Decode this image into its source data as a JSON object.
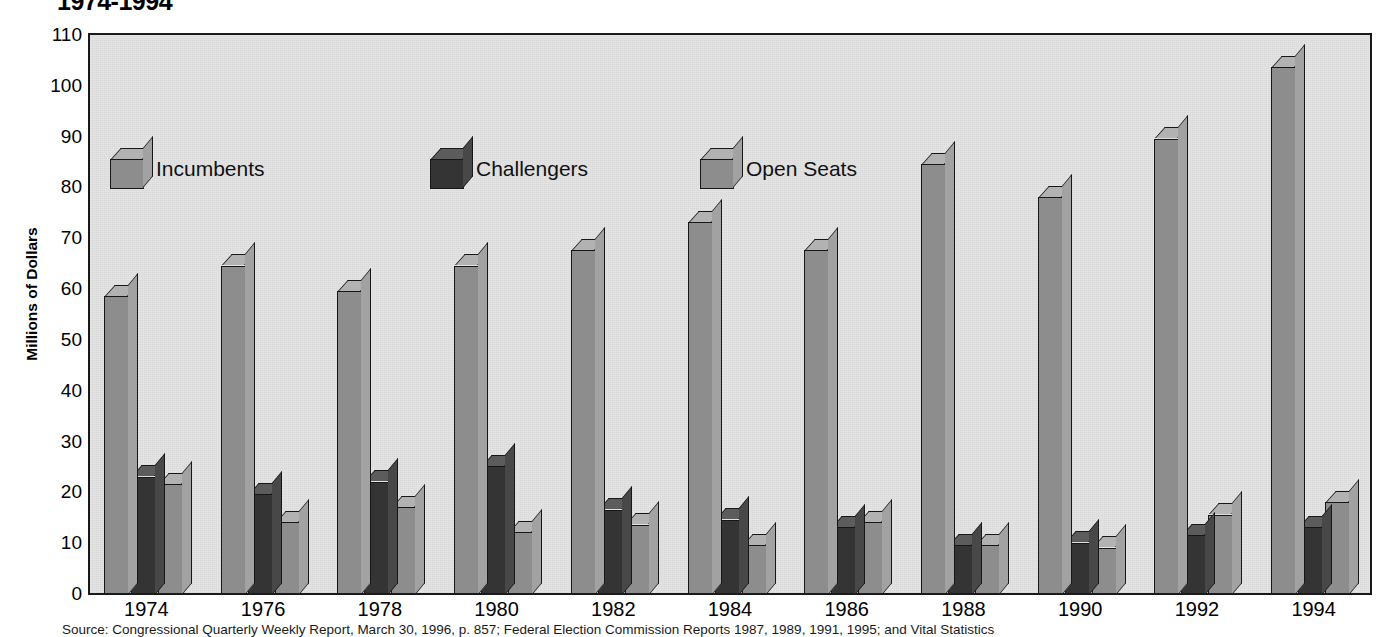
{
  "title": "1974-1994",
  "source_note": "Source: Congressional Quarterly Weekly Report, March 30, 1996, p. 857; Federal Election Commission Reports 1987, 1989, 1991, 1995; and Vital Statistics",
  "legend": {
    "position": "inside-top-left",
    "items": [
      {
        "label": "Incumbents",
        "key": "incumbents",
        "color": "#8d8d8d",
        "icon": "cube-swatch-icon"
      },
      {
        "label": "Challengers",
        "key": "challengers",
        "color": "#343434",
        "icon": "cube-swatch-icon"
      },
      {
        "label": "Open Seats",
        "key": "open_seats",
        "color": "#8d8d8d",
        "icon": "cube-swatch-icon"
      }
    ]
  },
  "chart_data": {
    "type": "bar",
    "title": "1974-1994",
    "xlabel": "",
    "ylabel": "Millions of Dollars",
    "ylim": [
      0,
      110
    ],
    "yticks": [
      0,
      10,
      20,
      30,
      40,
      50,
      60,
      70,
      80,
      90,
      100,
      110
    ],
    "ytick_labels": [
      "0",
      "10",
      "20",
      "30",
      "40",
      "50",
      "60",
      "70",
      "80",
      "90",
      "100",
      "110"
    ],
    "grid": false,
    "categories": [
      "1974",
      "1976",
      "1978",
      "1980",
      "1982",
      "1984",
      "1986",
      "1988",
      "1990",
      "1992",
      "1994"
    ],
    "series": [
      {
        "name": "Incumbents",
        "color": "#8d8d8d",
        "values": [
          59,
          65,
          60,
          65,
          68,
          73.5,
          68,
          85,
          78.5,
          90,
          104
        ]
      },
      {
        "name": "Challengers",
        "color": "#343434",
        "values": [
          23.5,
          20,
          22.5,
          25.5,
          17,
          15,
          13.5,
          10,
          10.5,
          12,
          13.5
        ]
      },
      {
        "name": "Open Seats",
        "color": "#8d8d8d",
        "values": [
          22,
          14.5,
          17.5,
          12.5,
          14,
          10,
          14.5,
          10,
          9.5,
          16,
          18.5
        ]
      }
    ],
    "plot_background": "#e3e3e3",
    "axis_color": "#1a1a1a"
  }
}
